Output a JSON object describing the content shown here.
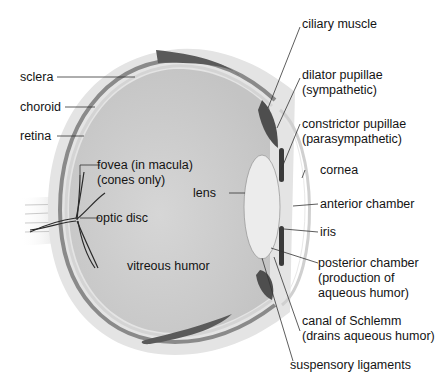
{
  "diagram": {
    "labels": {
      "ciliary_muscle": "ciliary muscle",
      "sclera": "sclera",
      "choroid": "choroid",
      "retina": "retina",
      "dilator_line1": "dilator pupillae",
      "dilator_line2": "(sympathetic)",
      "constrictor_line1": "constrictor pupillae",
      "constrictor_line2": "(parasympathetic)",
      "fovea_line1": "fovea (in macula)",
      "fovea_line2": "(cones only)",
      "cornea": "cornea",
      "lens": "lens",
      "anterior_chamber": "anterior chamber",
      "optic_disc": "optic disc",
      "iris": "iris",
      "vitreous_humor": "vitreous humor",
      "posterior_line1": "posterior chamber",
      "posterior_line2": "(production of",
      "posterior_line3": "aqueous humor)",
      "schlemm_line1": "canal of Schlemm",
      "schlemm_line2": "(drains aqueous humor)",
      "suspensory_ligaments": "suspensory ligaments"
    },
    "colors": {
      "sclera": "#e6e6e6",
      "choroid": "#8a8a8a",
      "vitreous": "#cfcfcf",
      "muscle": "#5a5a5a",
      "lens": "#ececec",
      "leader_line": "#333333"
    }
  }
}
